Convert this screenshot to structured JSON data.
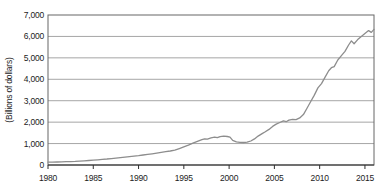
{
  "chart_data": {
    "type": "line",
    "title": "",
    "xlabel": "",
    "ylabel": "(Billions of dollars)",
    "xlim": [
      1980,
      2016
    ],
    "ylim": [
      0,
      7000
    ],
    "grid": "horizontal",
    "legend": "none",
    "x_ticks": [
      1980,
      1985,
      1990,
      1995,
      2000,
      2005,
      2010,
      2015
    ],
    "y_ticks": [
      {
        "value": 0,
        "label": "0"
      },
      {
        "value": 1000,
        "label": "1,000"
      },
      {
        "value": 2000,
        "label": "2,000"
      },
      {
        "value": 3000,
        "label": "3,000"
      },
      {
        "value": 4000,
        "label": "4,000"
      },
      {
        "value": 5000,
        "label": "5,000"
      },
      {
        "value": 6000,
        "label": "6,000"
      },
      {
        "value": 7000,
        "label": "7,000"
      }
    ],
    "series": [
      {
        "name": "billions-of-dollars",
        "points": [
          [
            1980,
            130
          ],
          [
            1980.5,
            133
          ],
          [
            1981,
            140
          ],
          [
            1981.5,
            146
          ],
          [
            1982,
            153
          ],
          [
            1982.5,
            161
          ],
          [
            1983,
            170
          ],
          [
            1983.5,
            181
          ],
          [
            1984,
            194
          ],
          [
            1984.5,
            209
          ],
          [
            1985,
            225
          ],
          [
            1985.5,
            244
          ],
          [
            1986,
            264
          ],
          [
            1986.5,
            282
          ],
          [
            1987,
            300
          ],
          [
            1987.5,
            322
          ],
          [
            1988,
            345
          ],
          [
            1988.5,
            369
          ],
          [
            1989,
            394
          ],
          [
            1989.5,
            417
          ],
          [
            1990,
            440
          ],
          [
            1990.5,
            467
          ],
          [
            1991,
            495
          ],
          [
            1991.5,
            524
          ],
          [
            1992,
            555
          ],
          [
            1992.5,
            587
          ],
          [
            1993,
            620
          ],
          [
            1993.5,
            654
          ],
          [
            1994,
            690
          ],
          [
            1994.5,
            765
          ],
          [
            1995,
            845
          ],
          [
            1995.5,
            925
          ],
          [
            1996,
            1020
          ],
          [
            1996.5,
            1105
          ],
          [
            1997,
            1180
          ],
          [
            1997.3,
            1225
          ],
          [
            1997.6,
            1205
          ],
          [
            1998,
            1265
          ],
          [
            1998.4,
            1300
          ],
          [
            1998.7,
            1275
          ],
          [
            1999,
            1325
          ],
          [
            1999.4,
            1350
          ],
          [
            1999.8,
            1330
          ],
          [
            2000.1,
            1300
          ],
          [
            2000.4,
            1150
          ],
          [
            2000.8,
            1080
          ],
          [
            2001.2,
            1060
          ],
          [
            2001.6,
            1048
          ],
          [
            2002,
            1065
          ],
          [
            2002.4,
            1120
          ],
          [
            2002.8,
            1220
          ],
          [
            2003.2,
            1350
          ],
          [
            2003.6,
            1450
          ],
          [
            2004,
            1550
          ],
          [
            2004.4,
            1660
          ],
          [
            2004.8,
            1800
          ],
          [
            2005.2,
            1910
          ],
          [
            2005.6,
            1985
          ],
          [
            2006,
            2060
          ],
          [
            2006.3,
            2020
          ],
          [
            2006.6,
            2095
          ],
          [
            2007,
            2130
          ],
          [
            2007.4,
            2115
          ],
          [
            2007.8,
            2200
          ],
          [
            2008.2,
            2350
          ],
          [
            2008.6,
            2650
          ],
          [
            2009,
            2950
          ],
          [
            2009.4,
            3250
          ],
          [
            2009.8,
            3600
          ],
          [
            2010.2,
            3800
          ],
          [
            2010.6,
            4100
          ],
          [
            2011,
            4400
          ],
          [
            2011.3,
            4540
          ],
          [
            2011.6,
            4590
          ],
          [
            2012,
            4900
          ],
          [
            2012.4,
            5100
          ],
          [
            2012.8,
            5300
          ],
          [
            2013.2,
            5600
          ],
          [
            2013.5,
            5790
          ],
          [
            2013.8,
            5660
          ],
          [
            2014.2,
            5850
          ],
          [
            2014.6,
            6000
          ],
          [
            2015,
            6130
          ],
          [
            2015.4,
            6270
          ],
          [
            2015.7,
            6190
          ],
          [
            2016,
            6330
          ]
        ]
      }
    ],
    "style": {
      "line_color": "#8d8d8d",
      "line_width": 1.3,
      "grid_color": "#a6a6a6",
      "border_color": "#676767",
      "axis_color": "#2e2e2e",
      "tick_length": 4,
      "background": "#ffffff"
    },
    "plot_rect": {
      "left": 48,
      "top": 15,
      "right": 374,
      "bottom": 165
    }
  }
}
